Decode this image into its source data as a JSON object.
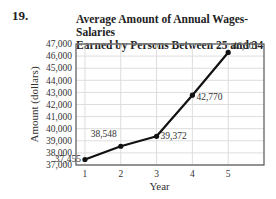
{
  "problem_number": "19.",
  "chart_data": {
    "type": "line",
    "title": "Average Amount of Annual Wages-Salaries Earned by Persons Between 25 and 34",
    "title_lines": [
      "Average Amount of Annual Wages-Salaries",
      "Earned by Persons Between 25 and 34"
    ],
    "xlabel": "Year",
    "ylabel": "Amount (dollars)",
    "x": [
      1,
      2,
      3,
      4,
      5
    ],
    "x_tick_labels": [
      "1",
      "2",
      "3",
      "4",
      "5"
    ],
    "xlim": [
      0.75,
      6
    ],
    "ylim": [
      37000,
      47000
    ],
    "y_ticks": [
      37000,
      38000,
      39000,
      40000,
      41000,
      42000,
      43000,
      44000,
      45000,
      46000,
      47000
    ],
    "y_tick_labels": [
      "37,000",
      "38,000",
      "39,000",
      "40,000",
      "41,000",
      "42,000",
      "43,000",
      "44,000",
      "45,000",
      "46,000",
      "47,000"
    ],
    "series": [
      {
        "name": "Average wages-salaries",
        "values": [
          37455,
          38548,
          39372,
          42770,
          46301
        ],
        "labels": [
          "37,455",
          "38,548",
          "39,372",
          "42,770",
          "46,301"
        ],
        "color": "#111111"
      }
    ],
    "grid": true,
    "legend": "none"
  }
}
